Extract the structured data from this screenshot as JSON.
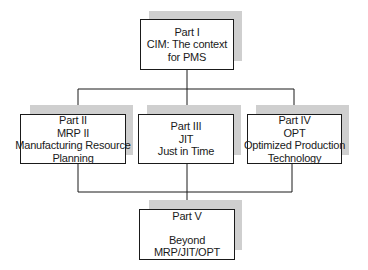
{
  "diagram": {
    "type": "hierarchy",
    "nodes": [
      {
        "id": "part1",
        "lines": [
          "Part I",
          "CIM: The context",
          "for PMS"
        ]
      },
      {
        "id": "part2",
        "lines": [
          "Part II",
          "MRP II",
          "Manufacturing Resource",
          "Planning"
        ]
      },
      {
        "id": "part3",
        "lines": [
          "Part III",
          "JIT",
          "Just in Time"
        ]
      },
      {
        "id": "part4",
        "lines": [
          "Part IV",
          "OPT",
          "Optimized Production",
          "Technology"
        ]
      },
      {
        "id": "part5",
        "lines": [
          "Part V",
          "",
          "Beyond",
          "MRP/JIT/OPT"
        ]
      }
    ],
    "edges": [
      {
        "from": "part1",
        "to": "part2"
      },
      {
        "from": "part1",
        "to": "part3"
      },
      {
        "from": "part1",
        "to": "part4"
      },
      {
        "from": "part2",
        "to": "part5"
      },
      {
        "from": "part3",
        "to": "part5"
      },
      {
        "from": "part4",
        "to": "part5"
      }
    ],
    "colors": {
      "line": "#1a1a1a",
      "shadow": "#cfcfcf",
      "box_fill": "#ffffff"
    }
  }
}
